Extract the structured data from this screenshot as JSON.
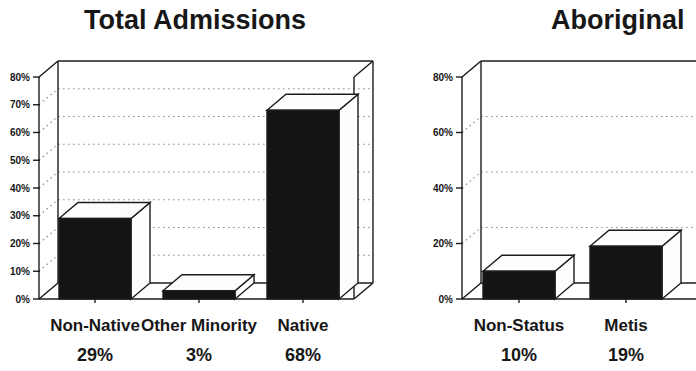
{
  "page": {
    "background": "#ffffff"
  },
  "chart_data": [
    {
      "type": "bar",
      "variant": "3d-column",
      "title": "Total Admissions",
      "categories": [
        "Non-Native",
        "Other Minority",
        "Native"
      ],
      "values": [
        29,
        3,
        68
      ],
      "value_labels": [
        "29%",
        "3%",
        "68%"
      ],
      "xlabel": "",
      "ylabel": "",
      "ylim": [
        0,
        80
      ],
      "y_ticks": [
        {
          "value": 0,
          "label": "0%"
        },
        {
          "value": 10,
          "label": "10%"
        },
        {
          "value": 20,
          "label": "20%"
        },
        {
          "value": 30,
          "label": "30%"
        },
        {
          "value": 40,
          "label": "40%"
        },
        {
          "value": 50,
          "label": "50%"
        },
        {
          "value": 60,
          "label": "60%"
        },
        {
          "value": 70,
          "label": "70%"
        },
        {
          "value": 80,
          "label": "80%"
        }
      ],
      "grid": "dotted-horizontal",
      "legend": null,
      "clipped_right": false
    },
    {
      "type": "bar",
      "variant": "3d-column",
      "title": "Aboriginal",
      "categories": [
        "Non-Status",
        "Metis"
      ],
      "values": [
        10,
        19
      ],
      "value_labels": [
        "10%",
        "19%"
      ],
      "xlabel": "",
      "ylabel": "",
      "ylim": [
        0,
        80
      ],
      "y_ticks": [
        {
          "value": 0,
          "label": "0%"
        },
        {
          "value": 20,
          "label": "20%"
        },
        {
          "value": 40,
          "label": "40%"
        },
        {
          "value": 60,
          "label": "60%"
        },
        {
          "value": 80,
          "label": "80%"
        }
      ],
      "grid": "dotted-horizontal",
      "legend": null,
      "clipped_right": true
    }
  ],
  "colors": {
    "bar_fill": "#141414",
    "bar_face": "#fdfdfd",
    "line": "#1c1c1c",
    "grid_dots": "#8f8f8f",
    "background": "#ffffff"
  }
}
